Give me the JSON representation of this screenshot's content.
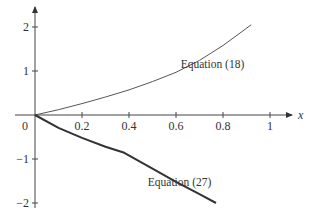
{
  "chart_data": {
    "type": "line",
    "title": "",
    "xlabel": "x",
    "ylabel": "",
    "xlim": [
      0,
      1.05
    ],
    "ylim": [
      -2.1,
      2.3
    ],
    "x_ticks": [
      0.2,
      0.4,
      0.6,
      0.8,
      1
    ],
    "x_tick_labels": [
      "0.2",
      "0.4",
      "0.6",
      "0.8",
      "1"
    ],
    "y_ticks": [
      -2,
      -1,
      1,
      2
    ],
    "y_tick_labels": [
      "−2",
      "−1",
      "1",
      "2"
    ],
    "origin_label": "0",
    "grid": false,
    "legend": "inline annotations",
    "series": [
      {
        "name": "Equation (18)",
        "style": "thin",
        "color": "#555555",
        "x": [
          0,
          0.1,
          0.2,
          0.3,
          0.4,
          0.5,
          0.6,
          0.7,
          0.8,
          0.92
        ],
        "y": [
          0,
          0.12,
          0.26,
          0.41,
          0.57,
          0.76,
          0.97,
          1.24,
          1.58,
          2.05
        ]
      },
      {
        "name": "Equation (27)",
        "style": "thick",
        "color": "#333333",
        "x": [
          0,
          0.1,
          0.2,
          0.3,
          0.38,
          0.5,
          0.6,
          0.7,
          0.77
        ],
        "y": [
          0,
          -0.29,
          -0.52,
          -0.72,
          -0.86,
          -1.22,
          -1.52,
          -1.8,
          -2.0
        ]
      }
    ],
    "annotations": [
      {
        "text": "Equation (18)",
        "x": 0.62,
        "y": 1.07
      },
      {
        "text": "Equation (27)",
        "x": 0.48,
        "y": -1.62
      }
    ]
  }
}
